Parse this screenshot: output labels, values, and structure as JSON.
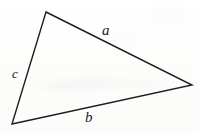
{
  "figure": {
    "type": "triangle-diagram",
    "canvas": {
      "width": 199,
      "height": 134
    },
    "background_color": "#fdfdfc",
    "stroke_color": "#1e1e1e",
    "stroke_width": 1.4,
    "vertices": [
      {
        "name": "apex",
        "x": 46,
        "y": 12
      },
      {
        "name": "right",
        "x": 192,
        "y": 85
      },
      {
        "name": "bottom-left",
        "x": 12,
        "y": 124
      }
    ],
    "sides": [
      {
        "id": "a",
        "label": "a",
        "from": "apex",
        "to": "right",
        "label_x": 107,
        "label_y": 31
      },
      {
        "id": "b",
        "label": "b",
        "from": "bottom-left",
        "to": "right",
        "label_x": 89,
        "label_y": 118
      },
      {
        "id": "c",
        "label": "c",
        "from": "apex",
        "to": "bottom-left",
        "label_x": 16,
        "label_y": 74
      }
    ]
  }
}
